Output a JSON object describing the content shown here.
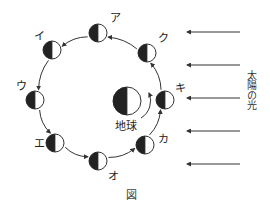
{
  "figure": {
    "caption": "図",
    "sunlight_label": "太陽の光",
    "earth_label": "地球",
    "colors": {
      "line": "#333333",
      "dark_half": "#222222",
      "light_half": "#ffffff"
    }
  },
  "earth": {
    "cx": 127,
    "cy": 101,
    "r": 14
  },
  "orbit": {
    "cx": 100,
    "cy": 97,
    "r": 66,
    "direction": "counterclockwise"
  },
  "moons": [
    {
      "label": "ア",
      "cx": 98,
      "cy": 33,
      "lx": 110,
      "ly": 22
    },
    {
      "label": "イ",
      "cx": 52,
      "cy": 50,
      "lx": 34,
      "ly": 40
    },
    {
      "label": "ウ",
      "cx": 35,
      "cy": 100,
      "lx": 16,
      "ly": 90
    },
    {
      "label": "エ",
      "cx": 55,
      "cy": 143,
      "lx": 34,
      "ly": 147
    },
    {
      "label": "オ",
      "cx": 98,
      "cy": 161,
      "lx": 108,
      "ly": 180
    },
    {
      "label": "カ",
      "cx": 145,
      "cy": 145,
      "lx": 158,
      "ly": 143
    },
    {
      "label": "キ",
      "cx": 165,
      "cy": 100,
      "lx": 175,
      "ly": 92
    },
    {
      "label": "ク",
      "cx": 147,
      "cy": 53,
      "lx": 158,
      "ly": 42
    }
  ],
  "sun_arrows": [
    {
      "y": 32
    },
    {
      "y": 65
    },
    {
      "y": 98
    },
    {
      "y": 131
    },
    {
      "y": 164
    }
  ]
}
